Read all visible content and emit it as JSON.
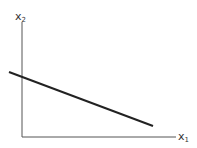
{
  "diagram": {
    "axes": {
      "x_label_main": "x",
      "x_label_sub": "1",
      "y_label_main": "x",
      "y_label_sub": "2",
      "color": "#555555"
    },
    "line": {
      "description": "straight line with negative slope crossing the x2 axis",
      "x1": 9,
      "y1": 72,
      "x2": 153,
      "y2": 126,
      "color": "#222222"
    }
  }
}
